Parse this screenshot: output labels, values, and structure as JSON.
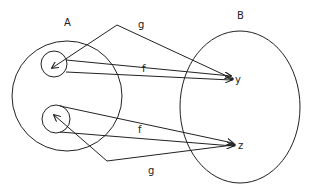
{
  "diagram": {
    "title": "",
    "sets": [
      {
        "id": "A",
        "label": "A"
      },
      {
        "id": "B",
        "label": "B"
      }
    ],
    "points": [
      {
        "id": "y",
        "label": "y",
        "set": "B"
      },
      {
        "id": "z",
        "label": "z",
        "set": "B"
      }
    ],
    "subsets_in_A": [
      {
        "id": "preimage-y",
        "description": "small circle around element mapped to y"
      },
      {
        "id": "preimage-z",
        "description": "small circle around element mapped to z"
      }
    ],
    "mappings": [
      {
        "label": "f",
        "from": "preimage-y",
        "to": "y"
      },
      {
        "label": "g",
        "from": "y",
        "to": "preimage-y"
      },
      {
        "label": "f",
        "from": "preimage-z",
        "to": "z"
      },
      {
        "label": "g",
        "from": "z",
        "to": "preimage-z"
      }
    ],
    "labels": {
      "set_a": "A",
      "set_b": "B",
      "point_y": "y",
      "point_z": "z",
      "f_top": "f",
      "g_top": "g",
      "f_bottom": "f",
      "g_bottom": "g"
    },
    "colors": {
      "stroke": "#222222",
      "background": "#ffffff"
    }
  }
}
